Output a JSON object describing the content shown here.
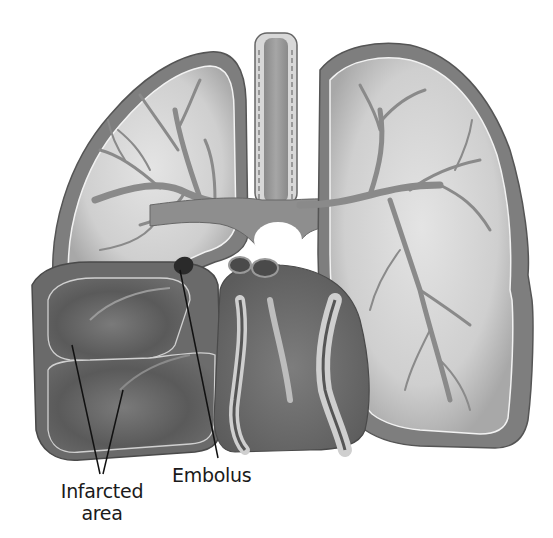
{
  "figure": {
    "style": "grayscale-illustration",
    "colors": {
      "background": "#ffffff",
      "pleura_outer": "#7a7a7a",
      "lung_parenchyma": "#d6d6d6",
      "vessels": "#8c8c8c",
      "infarct": "#5e5e5e",
      "heart": "#6f6f6f",
      "coronary_highlight": "#cfcfcf",
      "leader_lines": "#111111"
    }
  },
  "labels": {
    "infarcted_area": {
      "line1": "Infarcted",
      "line2": "area"
    },
    "embolus": "Embolus"
  }
}
